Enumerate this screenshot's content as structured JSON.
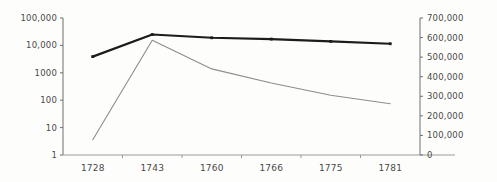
{
  "chart_data": {
    "type": "line",
    "title": "",
    "subtitle": "",
    "xlabel": "",
    "ylabel": "",
    "grid": false,
    "legend_position": "none",
    "categories": [
      "1728",
      "1743",
      "1760",
      "1766",
      "1775",
      "1781"
    ],
    "axes": {
      "left": {
        "scale": "log",
        "ylim": [
          1,
          100000
        ],
        "ticks": [
          1,
          10,
          100,
          1000,
          10000,
          100000
        ],
        "tick_labels": [
          "1",
          "10",
          "100",
          "1000",
          "10,000",
          "100,000"
        ]
      },
      "right": {
        "scale": "linear",
        "ylim": [
          0,
          700000
        ],
        "ticks": [
          0,
          100000,
          200000,
          300000,
          400000,
          500000,
          600000,
          700000
        ],
        "tick_labels": [
          "0",
          "100,000",
          "200,000",
          "300,000",
          "400,000",
          "500,000",
          "600,000",
          "700,000"
        ]
      }
    },
    "series": [
      {
        "name": "series-dark",
        "axis": "left",
        "color": "#1c1c1c",
        "line_width": 2.2,
        "markers": true,
        "values": [
          3900,
          25000,
          19000,
          17000,
          14000,
          11500
        ]
      },
      {
        "name": "series-gray",
        "axis": "right",
        "color": "#8d8d8d",
        "line_width": 1.1,
        "markers": false,
        "values": [
          78000,
          586000,
          440000,
          368000,
          305000,
          262000
        ]
      }
    ]
  },
  "axis_text": {
    "left_ticks": [
      "100,000",
      "10,000",
      "1000",
      "100",
      "10",
      "1"
    ],
    "right_ticks": [
      "700,000",
      "600,000",
      "500,000",
      "400,000",
      "300,000",
      "200,000",
      "100,000",
      "0"
    ],
    "x_ticks": [
      "1728",
      "1743",
      "1760",
      "1766",
      "1775",
      "1781"
    ]
  }
}
